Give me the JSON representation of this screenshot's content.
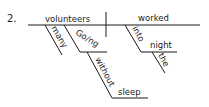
{
  "diagram": {
    "number": "2.",
    "subject": "volunteers",
    "verb": "worked",
    "subject_modifiers": {
      "adjective": "many",
      "participle": "Go/ng",
      "participle_preposition": "without",
      "participle_object": "sleep"
    },
    "verb_modifiers": {
      "preposition": "into",
      "object": "night",
      "article": "the"
    },
    "line_color": "#1a1a1a"
  }
}
